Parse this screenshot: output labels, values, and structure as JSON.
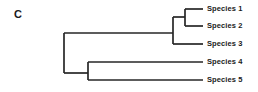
{
  "figure": {
    "panel_letter": "C",
    "type": "phylogenetic-cladogram",
    "line_color": "#262626",
    "text_color": "#1a1a1a",
    "background": "#ffffff"
  },
  "tips": [
    {
      "id": "species-1",
      "label": "Species 1",
      "y": 9,
      "branch_start_x": 185,
      "label_x": 207,
      "label_y": 5
    },
    {
      "id": "species-2",
      "label": "Species 2",
      "y": 26,
      "branch_start_x": 185,
      "label_x": 207,
      "label_y": 22
    },
    {
      "id": "species-3",
      "label": "Species 3",
      "y": 44,
      "branch_start_x": 173,
      "label_x": 207,
      "label_y": 40
    },
    {
      "id": "species-4",
      "label": "Species 4",
      "y": 62,
      "branch_start_x": 88,
      "label_x": 207,
      "label_y": 58
    },
    {
      "id": "species-5",
      "label": "Species 5",
      "y": 80,
      "branch_start_x": 88,
      "label_x": 207,
      "label_y": 76
    }
  ],
  "nodes": [
    {
      "id": "node-root",
      "x": 64,
      "y_top": 33,
      "y_bottom": 73
    },
    {
      "id": "node-clade-123",
      "x": 173,
      "y_top": 17,
      "y_bottom": 44
    },
    {
      "id": "node-clade-12",
      "x": 185,
      "y_top": 9,
      "y_bottom": 26
    },
    {
      "id": "node-clade-45",
      "x": 88,
      "y_top": 62,
      "y_bottom": 80
    }
  ],
  "branches": [
    {
      "id": "branch-root-upper",
      "x1": 64,
      "y1": 33,
      "x2": 173,
      "y2": 33
    },
    {
      "id": "branch-root-lower",
      "x1": 64,
      "y1": 73,
      "x2": 88,
      "y2": 73
    },
    {
      "id": "branch-clade12",
      "x1": 173,
      "y1": 17,
      "x2": 185,
      "y2": 17
    },
    {
      "id": "branch-tip-1",
      "x1": 185,
      "y1": 9,
      "x2": 203,
      "y2": 9
    },
    {
      "id": "branch-tip-2",
      "x1": 185,
      "y1": 26,
      "x2": 203,
      "y2": 26
    },
    {
      "id": "branch-tip-3",
      "x1": 173,
      "y1": 44,
      "x2": 203,
      "y2": 44
    },
    {
      "id": "branch-tip-4",
      "x1": 88,
      "y1": 62,
      "x2": 203,
      "y2": 62
    },
    {
      "id": "branch-tip-5",
      "x1": 88,
      "y1": 80,
      "x2": 203,
      "y2": 80
    }
  ],
  "chart_data": {
    "type": "tree",
    "title": "C",
    "newick": "(((Species 1,Species 2),Species 3),(Species 4,Species 5));",
    "leaf_labels": [
      "Species 1",
      "Species 2",
      "Species 3",
      "Species 4",
      "Species 5"
    ],
    "clades": [
      {
        "name": "clade-12",
        "members": [
          "Species 1",
          "Species 2"
        ]
      },
      {
        "name": "clade-123",
        "members": [
          "Species 1",
          "Species 2",
          "Species 3"
        ]
      },
      {
        "name": "clade-45",
        "members": [
          "Species 4",
          "Species 5"
        ]
      },
      {
        "name": "root",
        "members": [
          "Species 1",
          "Species 2",
          "Species 3",
          "Species 4",
          "Species 5"
        ]
      }
    ],
    "grid": false,
    "legend": null,
    "xlabel": "",
    "ylabel": ""
  }
}
